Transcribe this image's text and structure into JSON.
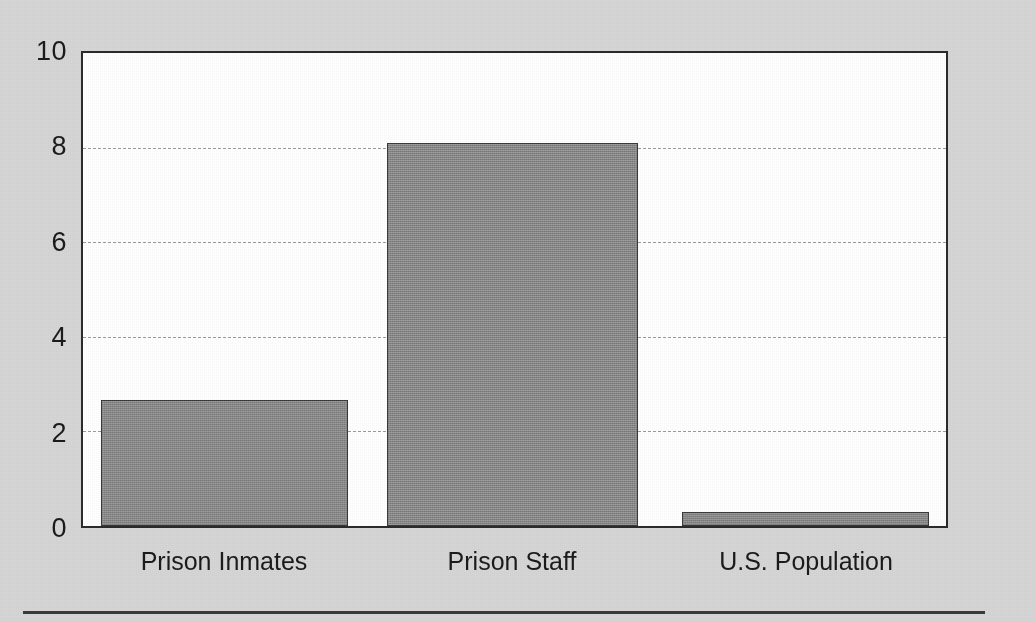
{
  "chart_data": {
    "type": "bar",
    "title": "",
    "xlabel": "",
    "ylabel": "",
    "categories": [
      "Prison Inmates",
      "Prison Staff",
      "U.S. Population"
    ],
    "values": [
      2.66,
      8.1,
      0.3
    ],
    "ylim": [
      0,
      10
    ],
    "ytick_labels": [
      "0",
      "2",
      "4",
      "6",
      "8",
      "10"
    ],
    "ytick_values": [
      0,
      2,
      4,
      6,
      8,
      10
    ],
    "gridlines": {
      "visible": true,
      "at": [
        2,
        4,
        6,
        8
      ],
      "style": "dashed",
      "axis": "y"
    },
    "legend": {
      "visible": false,
      "position": "none"
    },
    "series": [
      {
        "name": "",
        "values": [
          2.66,
          8.1,
          0.3
        ]
      }
    ]
  },
  "style": {
    "page_background": "#d6d6d6",
    "plot_background": "#ffffff",
    "bar_fill": "#8c8c8c",
    "bar_border": "#3a3a3a",
    "axis_color": "#2b2b2b",
    "grid_color": "#9a9a9a",
    "text_color": "#1b1b1b"
  },
  "footer": {
    "rule": true
  }
}
